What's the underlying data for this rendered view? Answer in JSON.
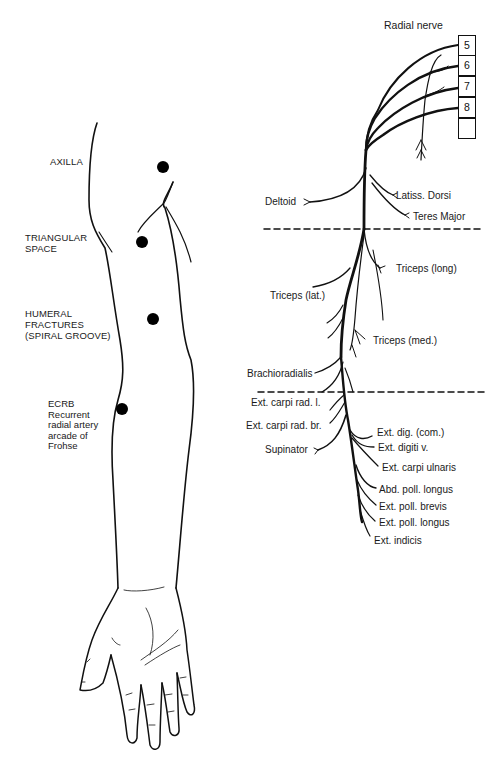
{
  "diagram": {
    "title": "Radial nerve",
    "left_panel": {
      "subject": "Right arm outline with compression sites",
      "sites": [
        {
          "label": "AXILLA",
          "marker": "dot"
        },
        {
          "label": "TRIANGULAR\nSPACE",
          "marker": "dot"
        },
        {
          "label": "HUMERAL\nFRACTURES\n(SPIRAL GROOVE)",
          "marker": "dot"
        },
        {
          "label": "ECRB\nRecurrent\nradial artery\narcade of\nFrohse",
          "marker": "dot"
        }
      ]
    },
    "right_panel": {
      "nerve_roots": [
        "5",
        "6",
        "7",
        "8",
        ""
      ],
      "branches_upper": [
        "Deltoid",
        "Latiss. Dorsi",
        "Teres Major"
      ],
      "branches_arm": [
        "Triceps (long)",
        "Triceps (lat.)",
        "Triceps (med.)",
        "Brachioradialis"
      ],
      "branches_forearm": [
        "Ext. carpi rad. l.",
        "Ext. carpi rad. br.",
        "Supinator",
        "Ext. dig. (com.)",
        "Ext. digiti v.",
        "Ext. carpi ulnaris",
        "Abd. poll. longus",
        "Ext. poll. brevis",
        "Ext. poll. longus",
        "Ext. indicis"
      ],
      "divider_lines": 2
    },
    "colors": {
      "ink": "#111111",
      "background": "#ffffff"
    }
  }
}
